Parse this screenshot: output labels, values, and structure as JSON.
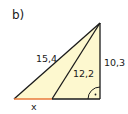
{
  "figure": {
    "part_label": "b)",
    "labels": {
      "hypotenuse": "15,4",
      "inner_segment": "12,2",
      "vertical_leg": "10,3",
      "unknown": "x"
    },
    "right_angle_marker": "right-angle-with-dot",
    "colors": {
      "fill": "#fdf8cf",
      "stroke": "#1a1a1a",
      "highlight_segment": "#e87a3a",
      "text": "#1a1a1a"
    },
    "vertices": {
      "apex": [
        100,
        23
      ],
      "bottom_left": [
        14,
        99
      ],
      "inner_base": [
        52,
        99
      ],
      "bottom_right": [
        100,
        99
      ]
    }
  }
}
